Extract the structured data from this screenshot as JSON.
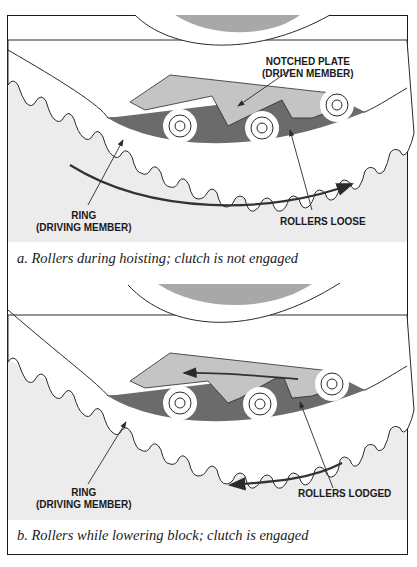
{
  "figure": {
    "panels": [
      {
        "id": "a",
        "labels": {
          "notched_plate_line1": "NOTCHED PLATE",
          "notched_plate_line2": "(DRIVEN MEMBER)",
          "ring_line1": "RING",
          "ring_line2": "(DRIVING MEMBER)",
          "rollers": "ROLLERS LOOSE"
        },
        "caption": "a.  Rollers during hoisting; clutch is not engaged",
        "rotation_direction": "clockwise-right"
      },
      {
        "id": "b",
        "labels": {
          "ring_line1": "RING",
          "ring_line2": "(DRIVING MEMBER)",
          "rollers": "ROLLERS LODGED"
        },
        "caption": "b.  Rollers while lowering block; clutch is engaged",
        "rotation_direction": "counterclockwise-left"
      }
    ],
    "colors": {
      "ring_fill": "#ececec",
      "race_dark": "#6b6b6b",
      "plate_light": "#c4c4c4",
      "hub": "#a8a8a8",
      "line": "#2a2a2a",
      "roller": "#ffffff"
    }
  }
}
